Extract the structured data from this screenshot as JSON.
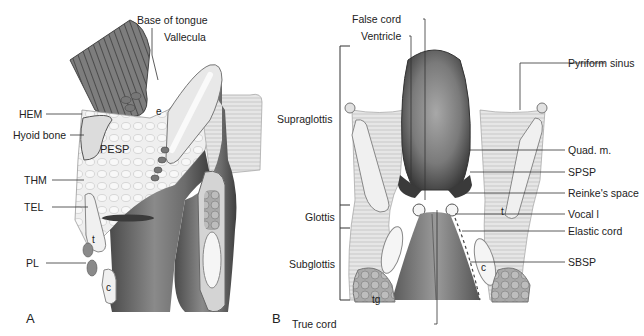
{
  "figure": {
    "panels": [
      {
        "letter": "A",
        "view": "sagittal section of larynx",
        "labels": {
          "base_of_tongue": "Base of tongue",
          "vallecula": "Vallecula",
          "hem": "HEM",
          "hyoid_bone": "Hyoid bone",
          "pesp": "PESP",
          "thm": "THM",
          "tel": "TEL",
          "pl": "PL",
          "e": "e",
          "t": "t",
          "c": "c"
        }
      },
      {
        "letter": "B",
        "view": "coronal section of larynx",
        "labels": {
          "false_cord": "False cord",
          "ventricle": "Ventricle",
          "supraglottis": "Supraglottis",
          "glottis": "Glottis",
          "subglottis": "Subglottis",
          "true_cord": "True cord",
          "pyriform_sinus": "Pyriform sinus",
          "quad_m": "Quad. m.",
          "spsp": "SPSP",
          "reinkes_space": "Reinke's space",
          "vocal_l": "Vocal l",
          "elastic_cord": "Elastic cord",
          "sbsp": "SBSP",
          "t": "t",
          "c": "c",
          "tg": "tg"
        }
      }
    ]
  }
}
